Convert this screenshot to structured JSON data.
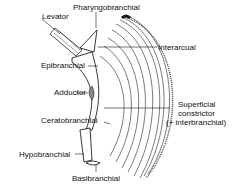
{
  "diagram": {
    "labels": {
      "pharyngobranchial": "Pharyngobranchial",
      "levator": "Levator",
      "interarcual": "Interarcual",
      "epibranchial": "Epibranchial",
      "adductor": "Adductor",
      "superficial_1": "Superficial",
      "superficial_2": "constrictor",
      "superficial_3": "(+ interbranchial)",
      "ceratobranchial": "Ceratobranchial",
      "hypobranchial": "Hypobranchial",
      "basibranchial": "Basibranchial"
    }
  }
}
